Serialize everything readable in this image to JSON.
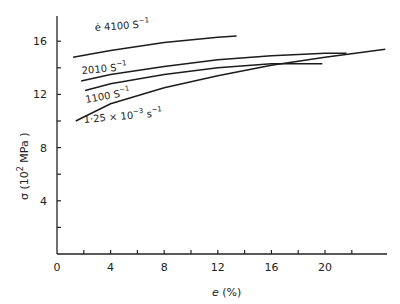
{
  "chart_data": {
    "type": "line",
    "title": "",
    "xlabel": "e (%)",
    "ylabel": "σ (10² MPa)",
    "xlim": [
      0,
      25
    ],
    "ylim": [
      0,
      18
    ],
    "xticks": [
      0,
      4,
      8,
      12,
      16,
      20
    ],
    "xminor_ticks": [
      2,
      6,
      10,
      14,
      18,
      22
    ],
    "yticks": [
      4,
      8,
      12,
      16
    ],
    "yminor_ticks": [
      2,
      6,
      10,
      14
    ],
    "grid": false,
    "legend_position": "inline labels",
    "series": [
      {
        "name": "ė 4100 S⁻¹",
        "label_parts": {
          "prefix": "ė 4100 S",
          "sup": "−1"
        },
        "x": [
          1.2,
          4,
          8,
          12,
          13.4
        ],
        "y": [
          14.8,
          15.3,
          15.9,
          16.3,
          16.4
        ]
      },
      {
        "name": "2010 S⁻¹",
        "label_parts": {
          "prefix": "2010 S",
          "sup": "−1"
        },
        "x": [
          1.8,
          4,
          8,
          12,
          16,
          20,
          21.6
        ],
        "y": [
          13.0,
          13.5,
          14.1,
          14.6,
          14.9,
          15.1,
          15.1
        ]
      },
      {
        "name": "1100 S⁻¹",
        "label_parts": {
          "prefix": "1100 S",
          "sup": "−1"
        },
        "x": [
          2.1,
          4,
          8,
          12,
          16,
          19.8
        ],
        "y": [
          12.3,
          12.8,
          13.5,
          14.0,
          14.3,
          14.3
        ]
      },
      {
        "name": "1.25×10⁻³ s⁻¹",
        "label_parts": {
          "prefix": "1·25 × 10",
          "sup1": "−3",
          "mid": " s",
          "sup2": "−1"
        },
        "x": [
          1.4,
          4,
          8,
          12,
          16,
          20,
          24.5
        ],
        "y": [
          10.0,
          11.3,
          12.5,
          13.4,
          14.2,
          14.8,
          15.4
        ]
      }
    ]
  },
  "axis": {
    "x_tick_labels": [
      "0",
      "4",
      "8",
      "12",
      "16",
      "20"
    ],
    "y_tick_labels": [
      "4",
      "8",
      "12",
      "16"
    ],
    "x_title_italic": "e",
    "x_title_rest": " (%)",
    "y_title_sigma": "σ",
    "y_title_open": " (10",
    "y_title_sup": "2",
    "y_title_close": " MPa )"
  }
}
